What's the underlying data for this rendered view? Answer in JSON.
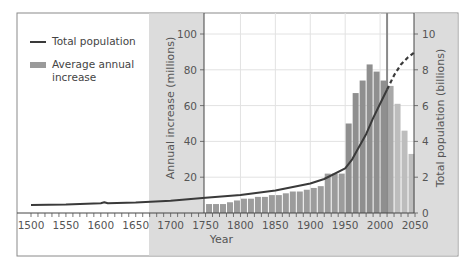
{
  "chart_data": {
    "type": "bar+line",
    "title": "",
    "xlabel": "Year",
    "ylabel_left": "Annual increase (millions)",
    "ylabel_right": "Total population (billions)",
    "x_ticks": [
      1500,
      1550,
      1600,
      1650,
      1700,
      1750,
      1800,
      1850,
      1900,
      1950,
      2000,
      2050
    ],
    "y_left_ticks": [
      20,
      40,
      60,
      80,
      100
    ],
    "y_left_range": [
      0,
      100
    ],
    "y_right_ticks": [
      0,
      2,
      4,
      6,
      8,
      10
    ],
    "y_right_range": [
      0,
      10
    ],
    "x_range": [
      1500,
      2050
    ],
    "grid": true,
    "current_year_marker": 2010,
    "legend": [
      {
        "name": "Total population",
        "style": "line",
        "color": "#3a3a3a"
      },
      {
        "name": "Average annual increase",
        "style": "bar",
        "color": "#9a9a9a"
      }
    ],
    "series": [
      {
        "name": "Average annual increase",
        "axis": "left",
        "type": "bar",
        "x": [
          1750,
          1760,
          1770,
          1780,
          1790,
          1800,
          1810,
          1820,
          1830,
          1840,
          1850,
          1860,
          1870,
          1880,
          1890,
          1900,
          1910,
          1920,
          1930,
          1940,
          1950,
          1960,
          1970,
          1980,
          1990,
          2000,
          2010,
          2020,
          2030,
          2040
        ],
        "values": [
          5,
          5,
          5,
          6,
          7,
          8,
          8,
          9,
          9,
          10,
          10,
          11,
          12,
          12,
          13,
          14,
          15,
          22,
          22,
          22,
          50,
          67,
          74,
          83,
          79,
          74,
          71,
          61,
          46,
          33
        ],
        "projected_from": 2010
      },
      {
        "name": "Total population",
        "axis": "right",
        "type": "line",
        "x": [
          1500,
          1550,
          1600,
          1605,
          1610,
          1650,
          1700,
          1750,
          1800,
          1850,
          1900,
          1920,
          1950,
          1960,
          1970,
          1980,
          1990,
          2000,
          2010,
          2020,
          2030,
          2040,
          2050
        ],
        "values": [
          0.45,
          0.47,
          0.55,
          0.6,
          0.55,
          0.58,
          0.68,
          0.85,
          1.0,
          1.26,
          1.65,
          1.9,
          2.5,
          3.0,
          3.7,
          4.4,
          5.3,
          6.1,
          6.9,
          7.7,
          8.3,
          8.7,
          9.0
        ],
        "projected_from": 2010
      }
    ]
  },
  "legend": {
    "line_label": "Total population",
    "bar_label": "Average annual increase"
  },
  "axes": {
    "x_title": "Year",
    "left_title": "Annual increase (millions)",
    "right_title": "Total population (billions)"
  }
}
